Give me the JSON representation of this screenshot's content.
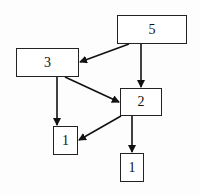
{
  "diagram": {
    "type": "tree",
    "background": "#fdfdfd",
    "stroke_color": "#111111",
    "nodes": [
      {
        "id": "n5",
        "label": "5",
        "x": 117,
        "y": 15,
        "w": 70,
        "h": 29
      },
      {
        "id": "n3",
        "label": "3",
        "x": 16,
        "y": 48,
        "w": 63,
        "h": 29
      },
      {
        "id": "n2",
        "label": "2",
        "x": 120,
        "y": 88,
        "w": 42,
        "h": 28
      },
      {
        "id": "n1a",
        "label": "1",
        "x": 53,
        "y": 126,
        "w": 25,
        "h": 29
      },
      {
        "id": "n1b",
        "label": "1",
        "x": 120,
        "y": 153,
        "w": 24,
        "h": 29
      }
    ],
    "edges": [
      {
        "from": "n5",
        "to": "n3",
        "x1": 129,
        "y1": 44,
        "x2": 80,
        "y2": 62
      },
      {
        "from": "n5",
        "to": "n2",
        "x1": 141,
        "y1": 44,
        "x2": 141,
        "y2": 87
      },
      {
        "from": "n3",
        "to": "n2",
        "x1": 65,
        "y1": 77,
        "x2": 119,
        "y2": 102
      },
      {
        "from": "n3",
        "to": "n1a",
        "x1": 57,
        "y1": 77,
        "x2": 57,
        "y2": 125
      },
      {
        "from": "n2",
        "to": "n1a",
        "x1": 121,
        "y1": 116,
        "x2": 79,
        "y2": 140
      },
      {
        "from": "n2",
        "to": "n1b",
        "x1": 132,
        "y1": 116,
        "x2": 132,
        "y2": 152
      }
    ]
  }
}
